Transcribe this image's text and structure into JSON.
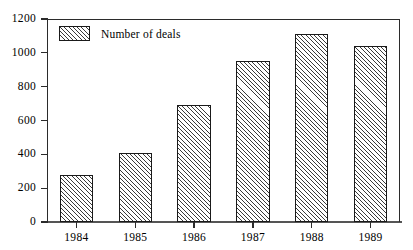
{
  "chart_data": {
    "type": "bar",
    "title": "",
    "subtitle": "",
    "xlabel": "",
    "ylabel": "",
    "categories": [
      "1984",
      "1985",
      "1986",
      "1987",
      "1988",
      "1989"
    ],
    "values": [
      280,
      410,
      690,
      950,
      1110,
      1040
    ],
    "series": [
      {
        "name": "Number of deals",
        "values": [
          280,
          410,
          690,
          950,
          1110,
          1040
        ]
      }
    ],
    "ylim": [
      0,
      1200
    ],
    "yticks": [
      0,
      200,
      400,
      600,
      800,
      1000,
      1200
    ],
    "ytick_labels": [
      "0",
      "200",
      "400",
      "600",
      "800",
      "1000",
      "1200"
    ],
    "grid": false,
    "legend": {
      "position": "top-left-inside",
      "entries": [
        "Number of deals"
      ]
    },
    "style": {
      "bar_fill": "diagonal-hatch",
      "bar_fill_color": "#ffffff",
      "hatch_line_color": "#3a3a3a",
      "bar_border_color": "#1a1a1a",
      "axis_color": "#2b2b2b",
      "background": "#ffffff",
      "text_color": "#000000"
    }
  },
  "legend": {
    "label": "Number of deals"
  },
  "axes": {
    "y": {
      "labels": [
        "1200",
        "1000",
        "800",
        "600",
        "400",
        "200",
        "0"
      ]
    },
    "x": {
      "labels": [
        "1984",
        "1985",
        "1986",
        "1987",
        "1988",
        "1989"
      ]
    }
  }
}
